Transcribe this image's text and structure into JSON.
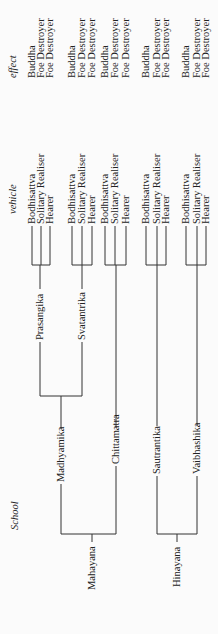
{
  "headers": {
    "school": "School",
    "vehicle": "vehicle",
    "effect": "effect"
  },
  "vehicles": [
    "Bodhisattva",
    "Solitary Realiser",
    "Hearer"
  ],
  "effects": [
    "Buddha",
    "Foe Destroyer",
    "Foe Destroyer"
  ],
  "vehicles_2": [
    "Bodhisattva",
    "Solitary Realiser",
    "Hearer"
  ],
  "effects_2": [
    "Buddha",
    "Foe Destroyer",
    "Foe Destroyer"
  ],
  "vehicles_3": [
    "Bodhisattva",
    "Solitary Realiser",
    "Hearer"
  ],
  "effects_3": [
    "Buddha",
    "Foe Destroyer",
    "Foe Destroyer"
  ],
  "vehicles_4": [
    "Bodhisattva",
    "Solitary Realiser",
    "Hearer"
  ],
  "effects_4": [
    "Buddha",
    "Foe Destroyer",
    "Foe Destroyer"
  ],
  "vehicles_5": [
    "Bodhisattva",
    "Solitary Realiser",
    "Hearer"
  ],
  "effects_5": [
    "Buddha",
    "Foe Destroyer",
    "Foe Destroyer"
  ],
  "schools": {
    "mahayana": "Mahayana",
    "hinayana": "Hinayana",
    "madhyamika": "Madhyamika",
    "chittamatra": "Chittamatra",
    "sautrantika": "Sautrantika",
    "vaibhashika": "Vaibhashika",
    "prasangika": "Prasangika",
    "svatantrika": "Svatantrika"
  }
}
